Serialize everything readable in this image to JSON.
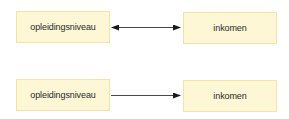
{
  "diagram": {
    "rows": [
      {
        "left": {
          "label": "opleidingsniveau"
        },
        "right": {
          "label": "inkomen"
        },
        "arrow": "bidirectional"
      },
      {
        "left": {
          "label": "opleidingsniveau"
        },
        "right": {
          "label": "inkomen"
        },
        "arrow": "left-to-right"
      }
    ],
    "colors": {
      "node_fill": "#fdf7d6",
      "node_border": "#f3e3a6",
      "arrow": "#1a1a1a",
      "text": "#2a2a2a"
    }
  }
}
